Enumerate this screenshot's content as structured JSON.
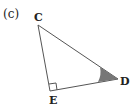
{
  "figure": {
    "part_label": "(c)",
    "shape": "right-triangle",
    "vertices": {
      "C": {
        "label": "C",
        "x": 38,
        "y": 25
      },
      "D": {
        "label": "D",
        "x": 118,
        "y": 79
      },
      "E": {
        "label": "E",
        "x": 50,
        "y": 91
      }
    },
    "right_angle_at": "E",
    "shaded_angle_at": "D",
    "colors": {
      "stroke": "#555555",
      "shade": "#777777",
      "text": "#222222"
    }
  }
}
